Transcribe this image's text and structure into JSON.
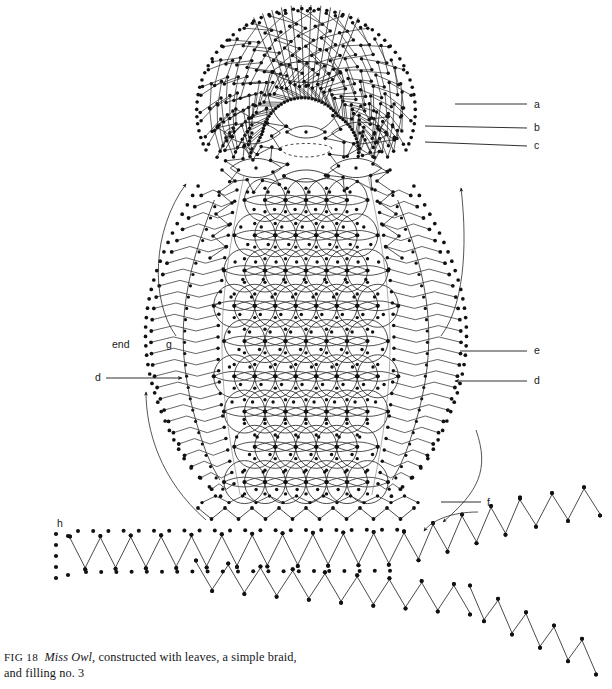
{
  "figure": {
    "id": "fig-18",
    "caption": {
      "figure_number": "FIG 18",
      "title": "Miss Owl",
      "rest": ", constructed with leaves, a simple braid,",
      "line2": "and filling no. 3"
    },
    "background_color": "#ffffff",
    "ink_color": "#1a1a1a",
    "width": 612,
    "height": 689
  },
  "labels": [
    {
      "key": "a",
      "text": "a",
      "x": 534,
      "y": 108,
      "leader": {
        "x1": 455,
        "y1": 104,
        "x2": 527,
        "y2": 104
      }
    },
    {
      "key": "b",
      "text": "b",
      "x": 534,
      "y": 131,
      "leader": {
        "x1": 425,
        "y1": 126,
        "x2": 527,
        "y2": 128
      }
    },
    {
      "key": "c",
      "text": "c",
      "x": 534,
      "y": 149,
      "leader": {
        "x1": 425,
        "y1": 142,
        "x2": 527,
        "y2": 146
      }
    },
    {
      "key": "e",
      "text": "e",
      "x": 534,
      "y": 354,
      "leader": {
        "x1": 460,
        "y1": 351,
        "x2": 527,
        "y2": 351
      }
    },
    {
      "key": "d-right",
      "text": "d",
      "x": 534,
      "y": 384,
      "leader": {
        "x1": 527,
        "y1": 381,
        "x2": 455,
        "y2": 381
      },
      "arrow": "left"
    },
    {
      "key": "d-left",
      "text": "d",
      "x": 95,
      "y": 381,
      "leader": {
        "x1": 106,
        "y1": 378,
        "x2": 182,
        "y2": 378
      },
      "arrow": "right"
    },
    {
      "key": "end",
      "text": "end",
      "x": 112,
      "y": 348
    },
    {
      "key": "g",
      "text": "g",
      "x": 166,
      "y": 348
    },
    {
      "key": "f",
      "text": "f",
      "x": 487,
      "y": 506,
      "leader": {
        "x1": 441,
        "y1": 502,
        "x2": 481,
        "y2": 502
      }
    },
    {
      "key": "h",
      "text": "h",
      "x": 57,
      "y": 527
    }
  ],
  "arrows": [
    {
      "name": "wing-arrow-upper-left",
      "description": "curved arrow sweeping up the left wing"
    },
    {
      "name": "wing-arrow-upper-right",
      "description": "curved arrow sweeping up the right wing"
    },
    {
      "name": "wing-arrow-lower-left",
      "description": "curved arrow sweeping up the lower left wing"
    },
    {
      "name": "wing-arrow-lower-right",
      "description": "curved arrow sweeping down to the right tail"
    },
    {
      "name": "braid-arrow-f",
      "description": "curved arrow from label f to the braid"
    }
  ],
  "diagram_parts": [
    {
      "name": "owl-head-leaf-fan",
      "description": "radiating leaf stitches forming the head crown"
    },
    {
      "name": "owl-eye-left",
      "description": "star-shaped leaf cluster, left eye"
    },
    {
      "name": "owl-eye-right",
      "description": "star-shaped leaf cluster, right eye"
    },
    {
      "name": "owl-beak",
      "description": "dashed oval beak between the eyes"
    },
    {
      "name": "owl-body-filling",
      "description": "filling no. 3 — interlocking rings lattice"
    },
    {
      "name": "owl-wing-left",
      "description": "zigzag leaf wing, left"
    },
    {
      "name": "owl-wing-right",
      "description": "zigzag leaf wing, right"
    },
    {
      "name": "owl-tail-scallop",
      "description": "scalloped zigzag hem at the base of the body"
    },
    {
      "name": "simple-braid",
      "description": "long zigzag simple braid with pin dots running under and away from the owl"
    }
  ]
}
